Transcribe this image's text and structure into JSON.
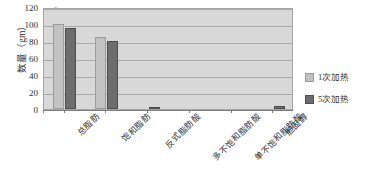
{
  "chart_data": {
    "type": "bar",
    "title": "",
    "xlabel": "",
    "ylabel": "数量（gm）",
    "ylim": [
      0,
      120
    ],
    "yticks": [
      0,
      20,
      40,
      60,
      80,
      100,
      120
    ],
    "ytick_labels": [
      "0",
      "20",
      "40",
      "60",
      "80",
      "100",
      "120"
    ],
    "grid": true,
    "legend_position": "right",
    "categories": [
      "总脂肪",
      "饱和脂肪",
      "反式脂肪酸",
      "多不饱和脂肪酸",
      "单不饱和脂肪酸",
      "胆固醇"
    ],
    "series": [
      {
        "name": "1次加热",
        "color": "#c2c2c2",
        "values": [
          100,
          85,
          0,
          0,
          0,
          0
        ]
      },
      {
        "name": "5次加热",
        "color": "#6d6d6d",
        "values": [
          95,
          80,
          2,
          0,
          0,
          3
        ]
      }
    ],
    "plot_background": "#d8d8d8",
    "axis_color": "#7d7d7d",
    "gridline_color": "#a9a9a9"
  }
}
